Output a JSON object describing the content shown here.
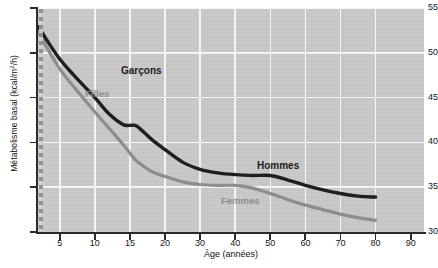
{
  "chart_data": {
    "type": "line",
    "title": "",
    "xlabel": "Âge (années)",
    "ylabel": "Métabolisme basal (kcal/m²/h)",
    "ylabel_plain": "Metabolisme basal (kcal/m2/h)",
    "xlim": [
      0,
      90
    ],
    "ylim": [
      30,
      55
    ],
    "yticks": [
      30,
      35,
      40,
      45,
      50,
      55
    ],
    "xticks": [
      5,
      10,
      15,
      20,
      30,
      40,
      50,
      60,
      70,
      80,
      90
    ],
    "x_axis_scale": "piecewise (5-year steps to 20, then 10-year steps to 90, evenly spaced)",
    "grid": true,
    "grid_color": "#f4f4f4",
    "plot_background": "#c9c9c9",
    "legend_position": "inline annotations on curves",
    "series": [
      {
        "name": "Garçons / Hommes",
        "label_child": "Garçons",
        "label_adult": "Hommes",
        "color": "#1f1f1f",
        "x": [
          0,
          1,
          2,
          3,
          5,
          7,
          10,
          12,
          14,
          15,
          16,
          18,
          20,
          25,
          30,
          35,
          40,
          45,
          50,
          55,
          60,
          65,
          70,
          75,
          80
        ],
        "y": [
          51.0,
          53.0,
          52.8,
          51.6,
          49.3,
          47.5,
          45.0,
          43.2,
          42.0,
          41.9,
          41.8,
          40.4,
          39.2,
          37.8,
          37.0,
          36.6,
          36.4,
          36.3,
          36.3,
          35.8,
          35.2,
          34.7,
          34.3,
          34.0,
          33.9
        ]
      },
      {
        "name": "Filles / Femmes",
        "label_child": "Filles",
        "label_adult": "Femmes",
        "color": "#8d8d8d",
        "x": [
          0,
          1,
          2,
          3,
          5,
          7,
          10,
          12,
          14,
          15,
          16,
          18,
          20,
          25,
          30,
          35,
          40,
          45,
          50,
          55,
          60,
          65,
          70,
          75,
          80
        ],
        "y": [
          51.0,
          52.8,
          52.2,
          50.8,
          48.2,
          46.2,
          43.4,
          41.6,
          39.8,
          38.8,
          37.9,
          36.8,
          36.2,
          35.6,
          35.3,
          35.2,
          35.2,
          34.9,
          34.3,
          33.6,
          33.0,
          32.5,
          32.0,
          31.6,
          31.3
        ]
      }
    ],
    "annotations": [
      {
        "text": "Garçons",
        "series": "Garçons / Hommes",
        "x_px": 83,
        "y_px": 57,
        "style": "dark"
      },
      {
        "text": "Filles",
        "series": "Filles / Femmes",
        "x_px": 47,
        "y_px": 80,
        "style": "light"
      },
      {
        "text": "Hommes",
        "series": "Garçons / Hommes",
        "x_px": 219,
        "y_px": 152,
        "style": "dark"
      },
      {
        "text": "Femmes",
        "series": "Filles / Femmes",
        "x_px": 183,
        "y_px": 187,
        "style": "light"
      }
    ]
  }
}
